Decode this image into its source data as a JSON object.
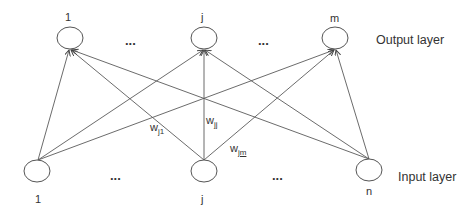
{
  "diagram": {
    "type": "neural-network-layers",
    "output_layer": {
      "label": "Output layer",
      "nodes": [
        {
          "id": "o1",
          "label": "1",
          "x": 70,
          "y": 38
        },
        {
          "id": "oj",
          "label": "j",
          "x": 204,
          "y": 38
        },
        {
          "id": "om",
          "label": "m",
          "x": 335,
          "y": 38
        }
      ],
      "ellipses": [
        "...",
        "..."
      ]
    },
    "input_layer": {
      "label": "Input layer",
      "nodes": [
        {
          "id": "i1",
          "label": "1",
          "x": 37,
          "y": 171
        },
        {
          "id": "ij",
          "label": "j",
          "x": 204,
          "y": 171
        },
        {
          "id": "in",
          "label": "n",
          "x": 369,
          "y": 170
        }
      ],
      "ellipses": [
        "...",
        "..."
      ]
    },
    "edges": [
      {
        "from": "i1",
        "to": "o1"
      },
      {
        "from": "i1",
        "to": "oj"
      },
      {
        "from": "i1",
        "to": "om"
      },
      {
        "from": "ij",
        "to": "o1"
      },
      {
        "from": "ij",
        "to": "oj"
      },
      {
        "from": "ij",
        "to": "om"
      },
      {
        "from": "in",
        "to": "o1"
      },
      {
        "from": "in",
        "to": "oj"
      },
      {
        "from": "in",
        "to": "om"
      }
    ],
    "weight_labels": [
      {
        "base": "w",
        "sub": "j1"
      },
      {
        "base": "w",
        "sub": "jj"
      },
      {
        "base": "w",
        "sub": "jm"
      }
    ]
  }
}
